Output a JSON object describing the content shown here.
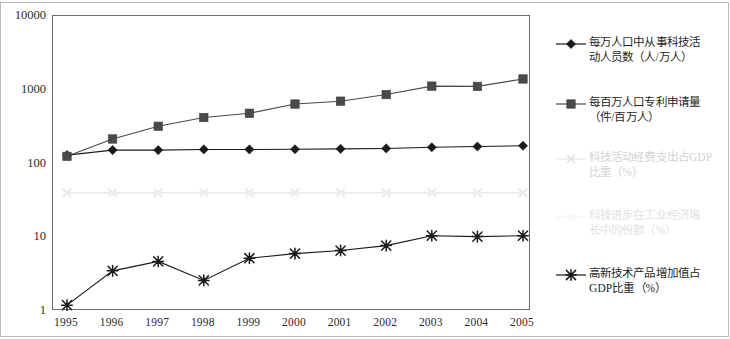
{
  "chart_data": {
    "type": "line",
    "title": "",
    "subtitle": "",
    "xlabel": "",
    "ylabel": "",
    "yscale": "log",
    "ylim": [
      1,
      10000
    ],
    "y_ticks": [
      "10000",
      "1000",
      "100",
      "10",
      "1"
    ],
    "grid": false,
    "legend_position": "right",
    "categories": [
      "1995",
      "1996",
      "1997",
      "1998",
      "1999",
      "2000",
      "2001",
      "2002",
      "2003",
      "2004",
      "2005"
    ],
    "series": [
      {
        "name": "每万人口中从事科技活动人员数（人/万人）",
        "label_line1": "每万人口中从事科技活",
        "label_line2": "动人员数（人/万人）",
        "marker": "diamond",
        "color": "#1a1a1a",
        "values": [
          130,
          152,
          152,
          155,
          155,
          156,
          158,
          160,
          166,
          170,
          174
        ]
      },
      {
        "name": "每百万人口专利申请量（件/百万人）",
        "label_line1": "每百万人口专利申请量",
        "label_line2": "（件/百万人）",
        "marker": "square",
        "color": "#4a4a4a",
        "values": [
          125,
          215,
          320,
          420,
          480,
          640,
          700,
          860,
          1120,
          1110,
          1400
        ]
      },
      {
        "name": "科技活动经费支出占GDP比重（%）",
        "label_line1": "科技活动经费支出占GDP",
        "label_line2": "比重（%）",
        "marker": "x",
        "color": "#e0e0e0",
        "values": [
          40,
          40,
          40,
          40,
          40,
          40,
          40,
          40,
          40,
          40,
          40
        ]
      },
      {
        "name": "科技进步在工业经济增长中的份额（%）",
        "label_line1": "科技进步在工业经济增",
        "label_line2": "长中的份额（%）",
        "marker": "x-hollow",
        "color": "#f0f0f0",
        "values": [
          39,
          39,
          39,
          39,
          39,
          39,
          39,
          39,
          39,
          39,
          39
        ]
      },
      {
        "name": "高新技术产品增加值占GDP比重（%）",
        "label_line1": "高新技术产品增加值占",
        "label_line2": "GDP比重（%）",
        "marker": "asterisk",
        "color": "#1a1a1a",
        "values": [
          1.2,
          3.5,
          4.7,
          2.6,
          5.2,
          6.0,
          6.6,
          7.7,
          10.5,
          10.2,
          10.5
        ]
      }
    ]
  },
  "axes": {
    "y_ticks": [
      {
        "label": "10000"
      },
      {
        "label": "1000"
      },
      {
        "label": "100"
      },
      {
        "label": "10"
      },
      {
        "label": "1"
      }
    ],
    "x_ticks": [
      {
        "label": "1995"
      },
      {
        "label": "1996"
      },
      {
        "label": "1997"
      },
      {
        "label": "1998"
      },
      {
        "label": "1999"
      },
      {
        "label": "2000"
      },
      {
        "label": "2001"
      },
      {
        "label": "2002"
      },
      {
        "label": "2003"
      },
      {
        "label": "2004"
      },
      {
        "label": "2005"
      }
    ]
  },
  "legend": {
    "entries": [
      {
        "marker": "diamond",
        "line1": "每万人口中从事科技活",
        "line2": "动人员数（人/万人）"
      },
      {
        "marker": "square",
        "line1": "每百万人口专利申请量",
        "line2": "（件/百万人）"
      },
      {
        "marker": "x",
        "line1": "科技活动经费支出占GDP",
        "line2": "比重（%）"
      },
      {
        "marker": "x-hollow",
        "line1": "科技进步在工业经济增",
        "line2": "长中的份额（%）"
      },
      {
        "marker": "asterisk",
        "line1": "高新技术产品增加值占",
        "line2": "GDP比重（%）"
      }
    ]
  },
  "colors": {
    "series_dark": "#1a1a1a",
    "series_gray": "#4a4a4a",
    "series_faint": "#e0e0e0",
    "axis": "#6e6e6e",
    "outer_frame": "#b9b9b9"
  }
}
